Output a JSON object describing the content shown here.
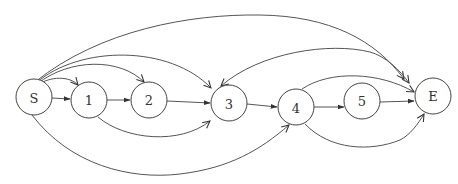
{
  "diagram": {
    "type": "directed-graph",
    "nodes": [
      {
        "id": "S",
        "label": "S",
        "x": 34,
        "y": 97
      },
      {
        "id": "1",
        "label": "1",
        "x": 89,
        "y": 100
      },
      {
        "id": "2",
        "label": "2",
        "x": 149,
        "y": 100
      },
      {
        "id": "3",
        "label": "3",
        "x": 229,
        "y": 103
      },
      {
        "id": "4",
        "label": "4",
        "x": 296,
        "y": 107
      },
      {
        "id": "5",
        "label": "5",
        "x": 362,
        "y": 101
      },
      {
        "id": "E",
        "label": "E",
        "x": 433,
        "y": 96
      }
    ],
    "edges": [
      {
        "from": "S",
        "to": "1",
        "style": "straight"
      },
      {
        "from": "S",
        "to": "1",
        "style": "arc-top"
      },
      {
        "from": "S",
        "to": "2",
        "style": "arc-top"
      },
      {
        "from": "S",
        "to": "3",
        "style": "arc-top"
      },
      {
        "from": "S",
        "to": "E",
        "style": "arc-top"
      },
      {
        "from": "S",
        "to": "4",
        "style": "arc-bottom"
      },
      {
        "from": "1",
        "to": "2",
        "style": "straight"
      },
      {
        "from": "1",
        "to": "3",
        "style": "arc-bottom"
      },
      {
        "from": "2",
        "to": "3",
        "style": "straight"
      },
      {
        "from": "3",
        "to": "4",
        "style": "straight"
      },
      {
        "from": "3",
        "to": "E",
        "style": "arc-top",
        "bidirectional": true
      },
      {
        "from": "4",
        "to": "5",
        "style": "straight"
      },
      {
        "from": "4",
        "to": "E",
        "style": "arc-top"
      },
      {
        "from": "4",
        "to": "E",
        "style": "arc-bottom"
      },
      {
        "from": "5",
        "to": "E",
        "style": "straight"
      }
    ]
  }
}
